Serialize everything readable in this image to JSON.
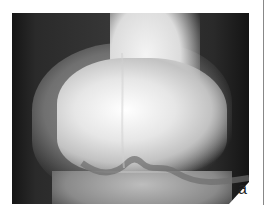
{
  "figure": {
    "panel_label": "a",
    "image_description": "Radiograph (X-ray) of a knee joint, distal femur condyles and proximal tibia",
    "colors": {
      "background": "#ffffff",
      "dark_tissue": "#1a1a1a",
      "bone_bright": "#ffffff",
      "divider_line": "#888888"
    }
  }
}
